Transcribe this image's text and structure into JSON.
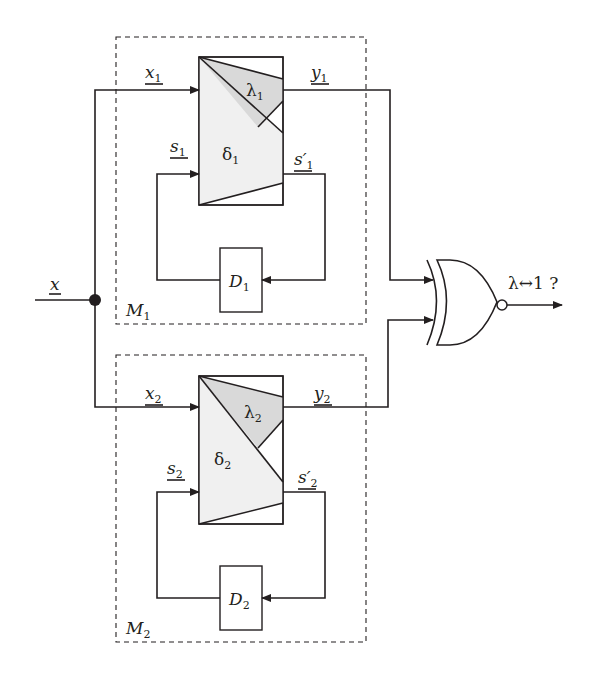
{
  "diagram": {
    "type": "block-diagram",
    "input": {
      "label": "x",
      "underlined": true
    },
    "output": {
      "label": "λ↔1 ?"
    },
    "gate": {
      "type": "XNOR",
      "inputs": [
        "y1",
        "y2"
      ]
    },
    "machines": [
      {
        "name": "M",
        "index": "1",
        "input_label": "x",
        "input_sub": "1",
        "output_label": "y",
        "output_sub": "1",
        "state_label": "s",
        "state_sub": "1",
        "next_state_label": "s′",
        "next_state_sub": "1",
        "output_fn": "λ",
        "output_fn_sub": "1",
        "transition_fn": "δ",
        "transition_fn_sub": "1",
        "delay": "D",
        "delay_sub": "1"
      },
      {
        "name": "M",
        "index": "2",
        "input_label": "x",
        "input_sub": "2",
        "output_label": "y",
        "output_sub": "2",
        "state_label": "s",
        "state_sub": "2",
        "next_state_label": "s′",
        "next_state_sub": "2",
        "output_fn": "λ",
        "output_fn_sub": "2",
        "transition_fn": "δ",
        "transition_fn_sub": "2",
        "delay": "D",
        "delay_sub": "2"
      }
    ],
    "colors": {
      "line": "#231f20",
      "lambda_fill": "#d9d9d9",
      "delta_fill": "#f0f0f0",
      "box_fill": "#ffffff"
    }
  }
}
